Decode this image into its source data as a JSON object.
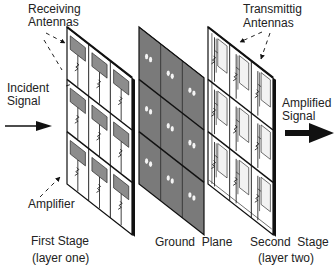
{
  "labels": {
    "receiving_antennas": [
      "Receiving",
      "Antennas"
    ],
    "incident_signal": [
      "Incident",
      "Signal"
    ],
    "amplifier": "Amplifier",
    "first_stage": [
      "First Stage",
      "(layer one)"
    ],
    "ground_plane": "Ground  Plane",
    "second_stage": [
      "Second  Stage",
      "(layer two)"
    ],
    "transmitting_antennas": [
      "Transmittig",
      "Antennas"
    ],
    "amplified_signal": [
      "Amplified",
      "Signal"
    ]
  },
  "layers": [
    {
      "id": "first-stage",
      "kind": "receiving",
      "rows": 3,
      "cols": 3
    },
    {
      "id": "ground-plane",
      "kind": "ground",
      "rows": 3,
      "cols": 3
    },
    {
      "id": "second-stage",
      "kind": "transmitting",
      "rows": 3,
      "cols": 3
    }
  ],
  "colors": {
    "ink": "#111111",
    "ground_fill": "#7a7a7a",
    "patch_fill": "#8c8c8c",
    "panel_fill": "#ffffff"
  }
}
